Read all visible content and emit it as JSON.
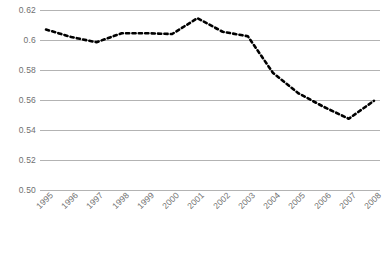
{
  "chart_data": {
    "type": "line",
    "title": "",
    "subtitle": "",
    "xlabel": "",
    "ylabel": "",
    "categories": [
      "1995",
      "1996",
      "1997",
      "1998",
      "1999",
      "2000",
      "2001",
      "2002",
      "2003",
      "2004",
      "2005",
      "2006",
      "2007",
      "2008"
    ],
    "series": [
      {
        "name": "",
        "values": [
          0.607,
          0.602,
          0.5985,
          0.6045,
          0.6045,
          0.604,
          0.6145,
          0.6055,
          0.6025,
          0.578,
          0.5645,
          0.5555,
          0.5475,
          0.5595
        ]
      }
    ],
    "ylim": [
      0.5,
      0.62
    ],
    "ytick_values": [
      0.62,
      0.6,
      0.58,
      0.56,
      0.54,
      0.52,
      0.5
    ],
    "ytick_labels": [
      "0.62",
      "0.6",
      "0.58",
      "0.56",
      "0.54",
      "0.52",
      "0.50"
    ],
    "grid": true,
    "grid_axis": "y",
    "legend": "none",
    "line_style": "dashed",
    "line_color": "#000000",
    "line_width": 2.6,
    "grid_color": "#b3b3b3",
    "axis_color": "#b3b3b3",
    "tick_label_color": "#6f6f6f",
    "background_color": "#ffffff",
    "xtick_rotation": -45
  }
}
